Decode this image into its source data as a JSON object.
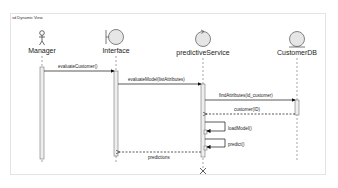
{
  "diagram": {
    "title": "sd Dynamic View",
    "lifelines": [
      {
        "name": "Manager",
        "kind": "actor"
      },
      {
        "name": "Interface",
        "kind": "boundary"
      },
      {
        "name": "predictiveService",
        "kind": "control"
      },
      {
        "name": "CustomerDB",
        "kind": "entity"
      }
    ],
    "messages": [
      {
        "label": "evaluateCustomer()",
        "from": "Manager",
        "to": "Interface",
        "type": "sync"
      },
      {
        "label": "evaluateModel(listAttributes)",
        "from": "Interface",
        "to": "predictiveService",
        "type": "sync"
      },
      {
        "label": "findAttributes(id_customer)",
        "from": "predictiveService",
        "to": "CustomerDB",
        "type": "sync"
      },
      {
        "label": "customer(ID)",
        "from": "CustomerDB",
        "to": "predictiveService",
        "type": "return"
      },
      {
        "label": "loadModel()",
        "from": "predictiveService",
        "to": "predictiveService",
        "type": "self"
      },
      {
        "label": "predict()",
        "from": "predictiveService",
        "to": "predictiveService",
        "type": "self"
      },
      {
        "label": "predictions",
        "from": "predictiveService",
        "to": "Interface",
        "type": "return"
      }
    ]
  }
}
